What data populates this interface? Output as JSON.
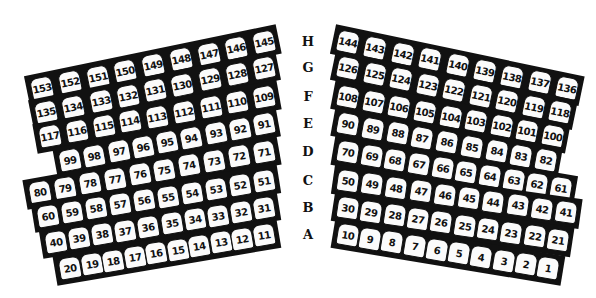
{
  "colors": {
    "ink": "#111111",
    "seat_fill": "#fbfbfb",
    "background": "#ffffff"
  },
  "row_labels": [
    "H",
    "G",
    "F",
    "E",
    "D",
    "C",
    "B",
    "A"
  ],
  "left_section": {
    "rows": [
      {
        "row": "H",
        "seats": [
          "153",
          "152",
          "151",
          "150",
          "149",
          "148",
          "147",
          "146",
          "145"
        ]
      },
      {
        "row": "G",
        "seats": [
          "135",
          "134",
          "133",
          "132",
          "131",
          "130",
          "129",
          "128",
          "127"
        ]
      },
      {
        "row": "F",
        "seats": [
          "117",
          "116",
          "115",
          "114",
          "113",
          "112",
          "111",
          "110",
          "109"
        ]
      },
      {
        "row": "E",
        "seats": [
          "99",
          "98",
          "97",
          "96",
          "95",
          "94",
          "93",
          "92",
          "91"
        ]
      },
      {
        "row": "D",
        "seats": [
          "80",
          "79",
          "78",
          "77",
          "76",
          "75",
          "74",
          "73",
          "72",
          "71"
        ]
      },
      {
        "row": "C",
        "seats": [
          "60",
          "59",
          "58",
          "57",
          "56",
          "55",
          "54",
          "53",
          "52",
          "51"
        ]
      },
      {
        "row": "B",
        "seats": [
          "40",
          "39",
          "38",
          "37",
          "36",
          "35",
          "34",
          "33",
          "32",
          "31"
        ]
      },
      {
        "row": "A",
        "seats": [
          "20",
          "19",
          "18",
          "17",
          "16",
          "15",
          "14",
          "13",
          "12",
          "11"
        ]
      }
    ]
  },
  "right_section": {
    "rows": [
      {
        "row": "H",
        "seats": [
          "144",
          "143",
          "142",
          "141",
          "140",
          "139",
          "138",
          "137",
          "136"
        ]
      },
      {
        "row": "G",
        "seats": [
          "126",
          "125",
          "124",
          "123",
          "122",
          "121",
          "120",
          "119",
          "118"
        ]
      },
      {
        "row": "F",
        "seats": [
          "108",
          "107",
          "106",
          "105",
          "104",
          "103",
          "102",
          "101",
          "100"
        ]
      },
      {
        "row": "E",
        "seats": [
          "90",
          "89",
          "88",
          "87",
          "86",
          "85",
          "84",
          "83",
          "82"
        ]
      },
      {
        "row": "D",
        "seats": [
          "70",
          "69",
          "68",
          "67",
          "66",
          "65",
          "64",
          "63",
          "62",
          "61"
        ]
      },
      {
        "row": "C",
        "seats": [
          "50",
          "49",
          "48",
          "47",
          "46",
          "45",
          "44",
          "43",
          "42",
          "41"
        ]
      },
      {
        "row": "B",
        "seats": [
          "30",
          "29",
          "28",
          "27",
          "26",
          "25",
          "24",
          "23",
          "22",
          "21"
        ]
      },
      {
        "row": "A",
        "seats": [
          "10",
          "9",
          "8",
          "7",
          "6",
          "5",
          "4",
          "3",
          "2",
          "1"
        ]
      }
    ]
  }
}
